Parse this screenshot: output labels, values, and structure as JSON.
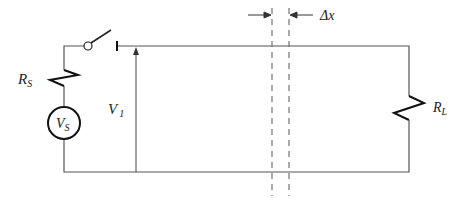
{
  "diagram": {
    "type": "circuit-schematic",
    "labels": {
      "rs_main": "R",
      "rs_sub": "S",
      "vs_main": "V",
      "vs_sub": "S",
      "v1_main": "V",
      "v1_sub": "1",
      "rl_main": "R",
      "rl_sub": "L",
      "dx": "Δx"
    },
    "components": [
      {
        "id": "R_S",
        "kind": "resistor",
        "label": "R_S"
      },
      {
        "id": "V_S",
        "kind": "voltage-source",
        "label": "V_S"
      },
      {
        "id": "switch",
        "kind": "switch",
        "state": "open"
      },
      {
        "id": "V_1",
        "kind": "voltage-indicator",
        "label": "V_1"
      },
      {
        "id": "R_L",
        "kind": "resistor",
        "label": "R_L"
      },
      {
        "id": "segment",
        "kind": "line-segment-marker",
        "label": "Δx"
      }
    ],
    "colors": {
      "wire": "#555555",
      "component": "#111111",
      "dashed": "#666666"
    }
  }
}
